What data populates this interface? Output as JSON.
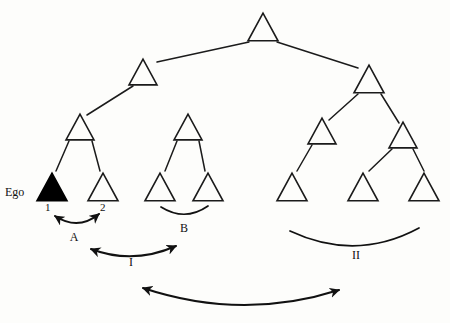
{
  "diagram": {
    "type": "tree-diagram",
    "background_color": "#fdfdfb",
    "line_color": "#1b1b1b",
    "ego_fill_color": "#000000"
  },
  "labels": {
    "ego": "Ego",
    "node_1": "1",
    "node_2": "2",
    "relation_a": "A",
    "relation_b": "B",
    "relation_i": "I",
    "relation_ii": "II"
  },
  "nodes": [
    {
      "id": "root",
      "name": "root-node",
      "cx": 263,
      "cy": 27,
      "size": 30,
      "filled": false,
      "level": 0
    },
    {
      "id": "l1a",
      "name": "left-branch-node",
      "cx": 143,
      "cy": 72,
      "size": 28,
      "filled": false,
      "level": 1
    },
    {
      "id": "l1b",
      "name": "right-branch-node",
      "cx": 369,
      "cy": 79,
      "size": 30,
      "filled": false,
      "level": 1
    },
    {
      "id": "l2a",
      "name": "lineage-a-parent",
      "cx": 80,
      "cy": 127,
      "size": 28,
      "filled": false,
      "level": 2
    },
    {
      "id": "l2b",
      "name": "lineage-b-parent",
      "cx": 188,
      "cy": 127,
      "size": 28,
      "filled": false,
      "level": 2
    },
    {
      "id": "l2c",
      "name": "lineage-c-parent",
      "cx": 322,
      "cy": 131,
      "size": 28,
      "filled": false,
      "level": 2
    },
    {
      "id": "l2d",
      "name": "lineage-d-parent",
      "cx": 403,
      "cy": 135,
      "size": 28,
      "filled": false,
      "level": 2
    },
    {
      "id": "ego",
      "name": "ego-node",
      "cx": 52,
      "cy": 187,
      "size": 30,
      "filled": true,
      "level": 3
    },
    {
      "id": "sib2",
      "name": "sibling-node-2",
      "cx": 103,
      "cy": 187,
      "size": 30,
      "filled": false,
      "level": 3
    },
    {
      "id": "b1",
      "name": "group-b-node-left",
      "cx": 160,
      "cy": 187,
      "size": 30,
      "filled": false,
      "level": 3
    },
    {
      "id": "b2",
      "name": "group-b-node-right",
      "cx": 208,
      "cy": 187,
      "size": 30,
      "filled": false,
      "level": 3
    },
    {
      "id": "c1",
      "name": "group-ii-node-left",
      "cx": 292,
      "cy": 187,
      "size": 30,
      "filled": false,
      "level": 3
    },
    {
      "id": "c2",
      "name": "group-ii-node-mid",
      "cx": 363,
      "cy": 187,
      "size": 30,
      "filled": false,
      "level": 3
    },
    {
      "id": "c3",
      "name": "group-ii-node-right",
      "cx": 424,
      "cy": 187,
      "size": 30,
      "filled": false,
      "level": 3
    }
  ],
  "links": [
    {
      "name": "link-root-to-left",
      "x1": 249,
      "y1": 42,
      "x2": 157,
      "y2": 62
    },
    {
      "name": "link-root-to-right",
      "x1": 277,
      "y1": 42,
      "x2": 358,
      "y2": 68
    },
    {
      "name": "link-left-to-l2a",
      "x1": 133,
      "y1": 86,
      "x2": 87,
      "y2": 115
    },
    {
      "name": "link-right-to-l2c",
      "x1": 358,
      "y1": 94,
      "x2": 329,
      "y2": 120
    },
    {
      "name": "link-right-to-l2d",
      "x1": 381,
      "y1": 94,
      "x2": 399,
      "y2": 123
    },
    {
      "name": "link-l2a-to-ego",
      "x1": 69,
      "y1": 141,
      "x2": 56,
      "y2": 171
    },
    {
      "name": "link-l2a-to-sib2",
      "x1": 92,
      "y1": 141,
      "x2": 100,
      "y2": 171
    },
    {
      "name": "link-l2b-to-b1",
      "x1": 177,
      "y1": 141,
      "x2": 165,
      "y2": 171
    },
    {
      "name": "link-l2b-to-b2",
      "x1": 199,
      "y1": 141,
      "x2": 205,
      "y2": 171
    },
    {
      "name": "link-l2c-to-c1",
      "x1": 312,
      "y1": 145,
      "x2": 297,
      "y2": 171
    },
    {
      "name": "link-l2d-to-c2",
      "x1": 392,
      "y1": 149,
      "x2": 369,
      "y2": 171
    },
    {
      "name": "link-l2d-to-c3",
      "x1": 413,
      "y1": 149,
      "x2": 424,
      "y2": 171
    }
  ],
  "relations": [
    {
      "id": "A",
      "name": "relation-arc-a",
      "label": "A",
      "label_x": 74,
      "label_y": 241,
      "path": "M 55 216 Q 78 231 99 214",
      "arrows": "both",
      "describes": "between ego (1) and sibling (2)"
    },
    {
      "id": "B",
      "name": "relation-arc-b",
      "label": "B",
      "label_x": 184,
      "label_y": 232,
      "path": "M 161 207 Q 185 222 208 206",
      "arrows": "none",
      "describes": "between the two group-B nodes"
    },
    {
      "id": "I",
      "name": "relation-arc-i",
      "label": "I",
      "label_x": 131,
      "label_y": 266,
      "path": "M 91 249 Q 133 265 176 246",
      "arrows": "both",
      "describes": "between lineage A pair and group B pair"
    },
    {
      "id": "II",
      "name": "relation-arc-ii",
      "label": "II",
      "label_x": 356,
      "label_y": 259,
      "path": "M 290 231 Q 356 262 419 228",
      "arrows": "none",
      "describes": "spanning the three right-hand nodes"
    },
    {
      "id": "bottom",
      "name": "relation-arc-bottom",
      "label": "",
      "label_x": 0,
      "label_y": 0,
      "path": "M 143 288 Q 242 321 339 290",
      "arrows": "both",
      "describes": "wide arc linking left cluster to right cluster"
    }
  ]
}
